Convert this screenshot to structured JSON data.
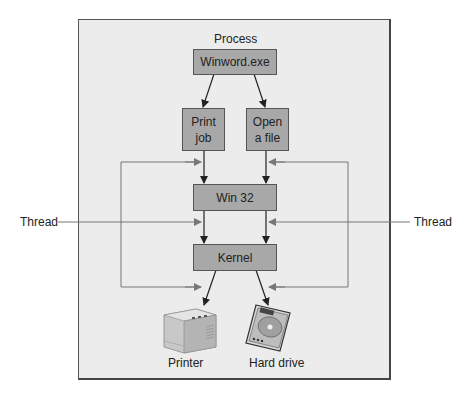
{
  "diagram": {
    "process_label": "Process",
    "nodes": {
      "winword": "Winword.exe",
      "print_job": "Print\njob",
      "open_file": "Open\na file",
      "win32": "Win 32",
      "kernel": "Kernel"
    },
    "thread_left": "Thread",
    "thread_right": "Thread",
    "devices": {
      "printer": "Printer",
      "hard_drive": "Hard drive"
    }
  },
  "colors": {
    "box_fill": "#a8a8a8",
    "frame_fill": "#ececec",
    "line": "#444444",
    "thread_line": "#888888"
  }
}
